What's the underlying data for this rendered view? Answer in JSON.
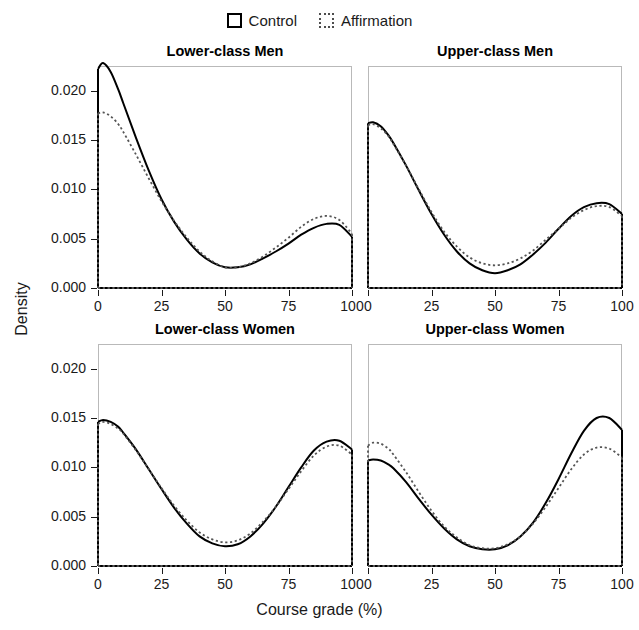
{
  "legend": {
    "position": "top-center",
    "entries": [
      {
        "label": "Control",
        "key": "solid-square-icon"
      },
      {
        "label": "Affirmation",
        "key": "dotted-square-icon"
      }
    ]
  },
  "axes": {
    "xlabel": "Course grade (%)",
    "ylabel": "Density",
    "xticks": [
      "0",
      "25",
      "50",
      "75",
      "100"
    ],
    "yticks": [
      "0.000",
      "0.005",
      "0.010",
      "0.015",
      "0.020"
    ],
    "xlim": [
      0,
      100
    ],
    "ylim": [
      0,
      0.0225
    ],
    "grid": false
  },
  "chart_data": {
    "type": "line",
    "title": "",
    "subtitle": "",
    "xlabel": "Course grade (%)",
    "ylabel": "Density",
    "xlim": [
      0,
      100
    ],
    "ylim": [
      0,
      0.0225
    ],
    "xticks": [
      0,
      25,
      50,
      75,
      100
    ],
    "yticks": [
      0.0,
      0.005,
      0.01,
      0.015,
      0.02
    ],
    "grid": false,
    "legend": [
      "Control",
      "Affirmation"
    ],
    "legend_position": "top-center",
    "panel_layout": "2x2",
    "panels": [
      {
        "title": "Lower-class Men",
        "row": 0,
        "col": 0,
        "x": [
          0,
          2,
          5,
          8,
          10,
          15,
          20,
          25,
          30,
          35,
          40,
          45,
          50,
          55,
          60,
          65,
          70,
          75,
          80,
          85,
          90,
          95,
          100
        ],
        "series": [
          {
            "name": "Control",
            "style": "solid",
            "values": [
              0.0222,
              0.0228,
              0.0219,
              0.0201,
              0.0187,
              0.0152,
              0.0119,
              0.009,
              0.0067,
              0.0049,
              0.0035,
              0.0026,
              0.0021,
              0.0021,
              0.0024,
              0.003,
              0.0037,
              0.0045,
              0.0054,
              0.0061,
              0.0065,
              0.0064,
              0.0052
            ]
          },
          {
            "name": "Affirmation",
            "style": "dotted",
            "values": [
              0.0177,
              0.0178,
              0.0174,
              0.0166,
              0.0158,
              0.0135,
              0.0111,
              0.0088,
              0.0068,
              0.0051,
              0.0037,
              0.0027,
              0.0021,
              0.0021,
              0.0025,
              0.0032,
              0.0041,
              0.0051,
              0.0062,
              0.007,
              0.0073,
              0.0069,
              0.0055
            ]
          }
        ]
      },
      {
        "title": "Upper-class Men",
        "row": 0,
        "col": 1,
        "x": [
          0,
          2,
          5,
          8,
          10,
          15,
          20,
          25,
          30,
          35,
          40,
          45,
          50,
          55,
          60,
          65,
          70,
          75,
          80,
          85,
          90,
          95,
          100
        ],
        "series": [
          {
            "name": "Control",
            "style": "solid",
            "values": [
              0.0167,
              0.0168,
              0.0164,
              0.0155,
              0.0147,
              0.0124,
              0.0099,
              0.0075,
              0.0054,
              0.0037,
              0.0025,
              0.0018,
              0.0015,
              0.0018,
              0.0024,
              0.0034,
              0.0046,
              0.006,
              0.0073,
              0.0082,
              0.0086,
              0.0085,
              0.0075
            ]
          },
          {
            "name": "Affirmation",
            "style": "dotted",
            "values": [
              0.0165,
              0.0166,
              0.0162,
              0.0154,
              0.0146,
              0.0124,
              0.01,
              0.0077,
              0.0057,
              0.0042,
              0.0031,
              0.0025,
              0.0023,
              0.0025,
              0.003,
              0.0038,
              0.0049,
              0.006,
              0.0071,
              0.0079,
              0.0083,
              0.0082,
              0.0073
            ]
          }
        ]
      },
      {
        "title": "Lower-class Women",
        "row": 1,
        "col": 0,
        "x": [
          0,
          2,
          5,
          8,
          10,
          15,
          20,
          25,
          30,
          35,
          40,
          45,
          50,
          55,
          60,
          65,
          70,
          75,
          80,
          85,
          90,
          95,
          100
        ],
        "series": [
          {
            "name": "Control",
            "style": "solid",
            "values": [
              0.0146,
              0.0148,
              0.0146,
              0.0141,
              0.0135,
              0.0118,
              0.0098,
              0.0078,
              0.0059,
              0.0043,
              0.003,
              0.0023,
              0.002,
              0.0022,
              0.003,
              0.0043,
              0.006,
              0.008,
              0.01,
              0.0117,
              0.0126,
              0.0127,
              0.0118
            ]
          },
          {
            "name": "Affirmation",
            "style": "dotted",
            "values": [
              0.0144,
              0.0146,
              0.0144,
              0.0139,
              0.0134,
              0.0117,
              0.0098,
              0.0079,
              0.0061,
              0.0046,
              0.0034,
              0.0027,
              0.0024,
              0.0026,
              0.0033,
              0.0045,
              0.006,
              0.0078,
              0.0096,
              0.0112,
              0.0121,
              0.0122,
              0.0113
            ]
          }
        ]
      },
      {
        "title": "Upper-class Women",
        "row": 1,
        "col": 1,
        "x": [
          0,
          2,
          5,
          8,
          10,
          15,
          20,
          25,
          30,
          35,
          40,
          45,
          50,
          55,
          60,
          65,
          70,
          75,
          80,
          85,
          90,
          95,
          100
        ],
        "series": [
          {
            "name": "Control",
            "style": "solid",
            "values": [
              0.0107,
              0.0108,
              0.0107,
              0.0103,
              0.0099,
              0.0085,
              0.0068,
              0.0052,
              0.0038,
              0.0027,
              0.002,
              0.0017,
              0.0017,
              0.0021,
              0.003,
              0.0044,
              0.0064,
              0.0088,
              0.0114,
              0.0137,
              0.015,
              0.015,
              0.0138
            ]
          },
          {
            "name": "Affirmation",
            "style": "dotted",
            "values": [
              0.0122,
              0.0125,
              0.0124,
              0.0119,
              0.0113,
              0.0095,
              0.0075,
              0.0056,
              0.004,
              0.0029,
              0.0021,
              0.0018,
              0.0018,
              0.0022,
              0.003,
              0.0043,
              0.006,
              0.0079,
              0.0098,
              0.0113,
              0.012,
              0.0119,
              0.011
            ]
          }
        ]
      }
    ]
  }
}
